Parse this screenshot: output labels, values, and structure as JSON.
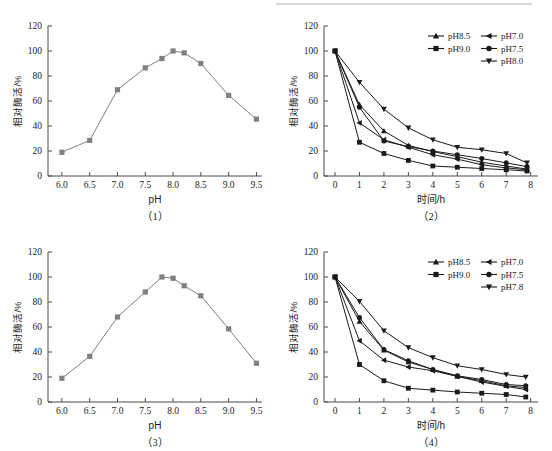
{
  "figure": {
    "axis_y_label": "相对酶活/%",
    "axis_x_label_ph": "pH",
    "axis_x_label_time": "时间/h",
    "y_ticks": [
      "0",
      "20",
      "40",
      "60",
      "80",
      "100",
      "120"
    ],
    "ph_x_ticks": [
      "6.0",
      "6.5",
      "7.0",
      "7.5",
      "8.0",
      "8.5",
      "9.0",
      "9.5"
    ],
    "time_x_ticks": [
      "0",
      "1",
      "2",
      "3",
      "4",
      "5",
      "6",
      "7",
      "8"
    ],
    "captions": {
      "p1": "（1）",
      "p2": "（2）",
      "p3": "（3）",
      "p4": "（4）"
    },
    "colors": {
      "ph_curve": "#808080",
      "stability_curve": "#1a1a1a",
      "axis": "#4a4a4a",
      "text": "#1a1a1a"
    }
  },
  "chart_data": [
    {
      "type": "line",
      "panel": "(1)",
      "title": "",
      "xlabel": "pH",
      "ylabel": "相对酶活/%",
      "xlim": [
        5.75,
        9.6
      ],
      "ylim": [
        0,
        120
      ],
      "grid": false,
      "legend": "none",
      "marker": "square",
      "x": [
        6.0,
        6.5,
        7.0,
        7.5,
        7.8,
        8.0,
        8.2,
        8.5,
        9.0,
        9.5
      ],
      "values": [
        19,
        28.5,
        69,
        86.5,
        94,
        100,
        98.5,
        90,
        64.5,
        45.5
      ]
    },
    {
      "type": "line",
      "panel": "(2)",
      "title": "",
      "xlabel": "时间/h",
      "ylabel": "相对酶活/%",
      "xlim": [
        -0.45,
        8.3
      ],
      "ylim": [
        0,
        120
      ],
      "grid": false,
      "legend": "upper-right",
      "x": [
        0,
        1,
        2,
        3,
        4,
        5,
        6,
        7,
        7.85
      ],
      "series": [
        {
          "name": "pH8.5",
          "marker": "triangle-up",
          "values": [
            100,
            57,
            36,
            24.5,
            19.5,
            15.5,
            11,
            8,
            5.5
          ]
        },
        {
          "name": "pH9.0",
          "marker": "square",
          "values": [
            100,
            27,
            18,
            12.5,
            8,
            7,
            6,
            5,
            4
          ]
        },
        {
          "name": "pH7.0",
          "marker": "triangle-left",
          "values": [
            100,
            42.5,
            29,
            23,
            17,
            13.5,
            9,
            6.5,
            5
          ]
        },
        {
          "name": "pH7.5",
          "marker": "circle",
          "values": [
            100,
            55,
            28,
            23.5,
            20,
            17,
            14,
            10.5,
            7.5
          ]
        },
        {
          "name": "pH8.0",
          "marker": "triangle-down",
          "values": [
            100,
            75,
            53.5,
            38.5,
            29,
            23,
            21,
            18,
            10.5
          ]
        }
      ]
    },
    {
      "type": "line",
      "panel": "(3)",
      "title": "",
      "xlabel": "pH",
      "ylabel": "相对酶活/%",
      "xlim": [
        5.75,
        9.6
      ],
      "ylim": [
        0,
        120
      ],
      "grid": false,
      "legend": "none",
      "marker": "square",
      "x": [
        6.0,
        6.5,
        7.0,
        7.5,
        7.8,
        8.0,
        8.2,
        8.5,
        9.0,
        9.5
      ],
      "values": [
        19,
        36.5,
        68,
        88,
        100,
        99,
        93,
        85,
        58.5,
        31
      ]
    },
    {
      "type": "line",
      "panel": "(4)",
      "title": "",
      "xlabel": "时间/h",
      "ylabel": "相对酶活/%",
      "xlim": [
        -0.45,
        8.3
      ],
      "ylim": [
        0,
        120
      ],
      "grid": false,
      "legend": "upper-right",
      "x": [
        0,
        1,
        2,
        3,
        4,
        5,
        6,
        7,
        7.8
      ],
      "series": [
        {
          "name": "pH8.5",
          "marker": "triangle-up",
          "values": [
            100,
            64.5,
            41.5,
            32,
            26,
            20.5,
            17,
            13,
            11.5
          ]
        },
        {
          "name": "pH9.0",
          "marker": "square",
          "values": [
            100,
            30,
            17,
            11,
            9.5,
            8,
            7,
            6,
            4
          ]
        },
        {
          "name": "pH7.0",
          "marker": "triangle-left",
          "values": [
            100,
            49,
            33.5,
            28,
            25,
            20.5,
            16,
            12.5,
            10
          ]
        },
        {
          "name": "pH7.5",
          "marker": "circle",
          "values": [
            100,
            67.5,
            42,
            33,
            26,
            21,
            18,
            14,
            13
          ]
        },
        {
          "name": "pH7.8",
          "marker": "triangle-down",
          "values": [
            100,
            80.5,
            57,
            43.5,
            35.5,
            29,
            26,
            22,
            20
          ]
        }
      ]
    }
  ],
  "legends": {
    "p2": [
      {
        "label": "pH8.5",
        "marker": "triangle-up"
      },
      {
        "label": "pH7.0",
        "marker": "triangle-left"
      },
      {
        "label": "pH9.0",
        "marker": "square"
      },
      {
        "label": "pH7.5",
        "marker": "circle"
      },
      {
        "label": "pH8.0",
        "marker": "triangle-down"
      }
    ],
    "p4": [
      {
        "label": "pH8.5",
        "marker": "triangle-up"
      },
      {
        "label": "pH7.0",
        "marker": "triangle-left"
      },
      {
        "label": "pH9.0",
        "marker": "square"
      },
      {
        "label": "pH7.5",
        "marker": "circle"
      },
      {
        "label": "pH7.8",
        "marker": "triangle-down"
      }
    ]
  }
}
